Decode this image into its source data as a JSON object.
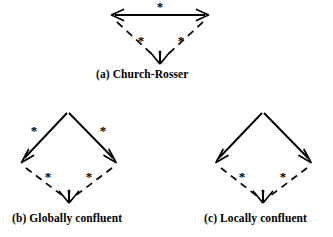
{
  "figure": {
    "background_color": "#ffffff",
    "ink_color": "#000000",
    "star_symbol": "*",
    "panels": [
      {
        "id": "a",
        "caption": "(a) Church-Rosser",
        "kind": "church-rosser",
        "description": "Horizontal double-headed arrow labelled star, with two dashed arrows converging to a single point below.",
        "labels": {
          "top": "*",
          "left_lower": "*",
          "right_lower": "*"
        },
        "geometry": {
          "top_left": [
            112,
            15
          ],
          "top_right": [
            208,
            15
          ],
          "meet": [
            160,
            62
          ]
        },
        "edges": [
          {
            "name": "top-edge",
            "style": "solid",
            "arrowheads": "both",
            "label": "*"
          },
          {
            "name": "left-descent",
            "style": "dashed",
            "arrowheads": "end",
            "label": "*"
          },
          {
            "name": "right-descent",
            "style": "dashed",
            "arrowheads": "end",
            "label": "*"
          }
        ]
      },
      {
        "id": "b",
        "caption": "(b) Globally confluent",
        "kind": "globally-confluent",
        "description": "Diamond: two solid arrows labelled star descend from the apex, then two dashed arrows labelled star converge below.",
        "labels": {
          "left_upper": "*",
          "right_upper": "*",
          "left_lower": "*",
          "right_lower": "*"
        },
        "geometry": {
          "apex": [
            68,
            112
          ],
          "left": [
            23,
            162
          ],
          "right": [
            115,
            162
          ],
          "meet": [
            69,
            200
          ]
        },
        "edges": [
          {
            "name": "upper-left-edge",
            "style": "solid",
            "arrowheads": "end",
            "label": "*"
          },
          {
            "name": "upper-right-edge",
            "style": "solid",
            "arrowheads": "end",
            "label": "*"
          },
          {
            "name": "lower-left-edge",
            "style": "dashed",
            "arrowheads": "end",
            "label": "*"
          },
          {
            "name": "lower-right-edge",
            "style": "dashed",
            "arrowheads": "end",
            "label": "*"
          }
        ]
      },
      {
        "id": "c",
        "caption": "(c) Locally confluent",
        "kind": "locally-confluent",
        "description": "Diamond: two unlabelled solid arrows descend from the apex, then two dashed arrows labelled star converge below.",
        "labels": {
          "left_upper": "",
          "right_upper": "",
          "left_lower": "*",
          "right_lower": "*"
        },
        "geometry": {
          "apex": [
            263,
            112
          ],
          "left": [
            217,
            162
          ],
          "right": [
            310,
            162
          ],
          "meet": [
            263,
            200
          ]
        },
        "edges": [
          {
            "name": "upper-left-edge",
            "style": "solid",
            "arrowheads": "end",
            "label": ""
          },
          {
            "name": "upper-right-edge",
            "style": "solid",
            "arrowheads": "end",
            "label": ""
          },
          {
            "name": "lower-left-edge",
            "style": "dashed",
            "arrowheads": "end",
            "label": "*"
          },
          {
            "name": "lower-right-edge",
            "style": "dashed",
            "arrowheads": "end",
            "label": "*"
          }
        ]
      }
    ],
    "star_positions": {
      "a_top": [
        160,
        6
      ],
      "a_left": [
        141,
        40
      ],
      "a_right": [
        181,
        40
      ],
      "b_upper_left": [
        34,
        130
      ],
      "b_upper_right": [
        103,
        130
      ],
      "b_lower_left": [
        48,
        176
      ],
      "b_lower_right": [
        89,
        176
      ],
      "c_lower_left": [
        242,
        176
      ],
      "c_lower_right": [
        283,
        176
      ]
    }
  }
}
